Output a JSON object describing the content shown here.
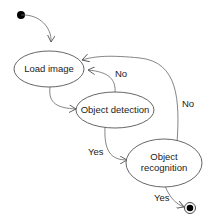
{
  "diagram": {
    "type": "state-machine",
    "nodes": [
      {
        "id": "start",
        "kind": "initial"
      },
      {
        "id": "load",
        "label": "Load image"
      },
      {
        "id": "detect",
        "label": "Object detection"
      },
      {
        "id": "recog",
        "label_line1": "Object",
        "label_line2": "recognition"
      },
      {
        "id": "end",
        "kind": "final"
      }
    ],
    "edges": [
      {
        "from": "start",
        "to": "load",
        "label": ""
      },
      {
        "from": "load",
        "to": "detect",
        "label": ""
      },
      {
        "from": "detect",
        "to": "load",
        "label": "No"
      },
      {
        "from": "detect",
        "to": "recog",
        "label": "Yes"
      },
      {
        "from": "recog",
        "to": "load",
        "label": "No"
      },
      {
        "from": "recog",
        "to": "end",
        "label": "Yes"
      }
    ]
  },
  "labels": {
    "load": "Load image",
    "detect": "Object detection",
    "recog1": "Object",
    "recog2": "recognition",
    "no1": "No",
    "no2": "No",
    "yes1": "Yes",
    "yes2": "Yes"
  }
}
